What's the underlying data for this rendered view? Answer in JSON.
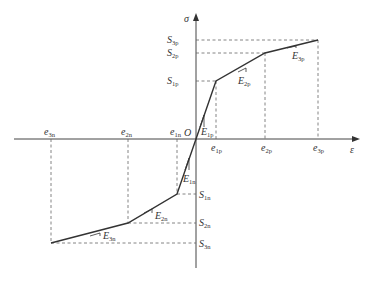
{
  "diagram": {
    "type": "piecewise-linear stress-strain (trilinear) diagram",
    "axes": {
      "x_label": "ε",
      "y_label": "σ",
      "origin_label": "O"
    },
    "positive_branch": {
      "strain_labels": [
        {
          "base": "e",
          "sub": "1p"
        },
        {
          "base": "e",
          "sub": "2p"
        },
        {
          "base": "e",
          "sub": "3p"
        }
      ],
      "stress_labels": [
        {
          "base": "S",
          "sub": "1p"
        },
        {
          "base": "S",
          "sub": "2p"
        },
        {
          "base": "S",
          "sub": "3p"
        }
      ],
      "modulus_labels": [
        {
          "base": "E",
          "sub": "1p"
        },
        {
          "base": "E",
          "sub": "2p"
        },
        {
          "base": "E",
          "sub": "3p"
        }
      ]
    },
    "negative_branch": {
      "strain_labels": [
        {
          "base": "e",
          "sub": "1n"
        },
        {
          "base": "e",
          "sub": "2n"
        },
        {
          "base": "e",
          "sub": "3n"
        }
      ],
      "stress_labels": [
        {
          "base": "S",
          "sub": "1n"
        },
        {
          "base": "S",
          "sub": "2n"
        },
        {
          "base": "S",
          "sub": "3n"
        }
      ],
      "modulus_labels": [
        {
          "base": "E",
          "sub": "1n"
        },
        {
          "base": "E",
          "sub": "2n"
        },
        {
          "base": "E",
          "sub": "3n"
        }
      ]
    },
    "colors": {
      "curve": "#333333",
      "axis": "#444444",
      "dashed": "#666666"
    }
  }
}
